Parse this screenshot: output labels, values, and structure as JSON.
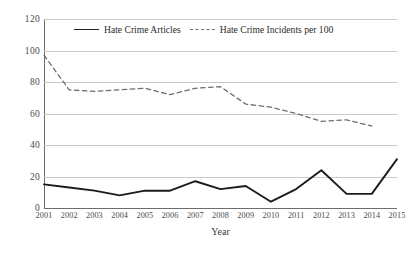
{
  "chart_data": {
    "type": "line",
    "title": "",
    "xlabel": "Year",
    "ylabel": "",
    "grid": true,
    "legend_position": "top-center",
    "xlim": [
      2001,
      2015
    ],
    "ylim": [
      0,
      120
    ],
    "ytick_labels": [
      "120",
      "100",
      "80",
      "60",
      "40",
      "20",
      "0"
    ],
    "ytick_values": [
      120,
      100,
      80,
      60,
      40,
      20,
      0
    ],
    "categories": [
      2001,
      2002,
      2003,
      2004,
      2005,
      2006,
      2007,
      2008,
      2009,
      2010,
      2011,
      2012,
      2013,
      2014,
      2015
    ],
    "xtick_labels": [
      "2001",
      "2002",
      "2003",
      "2004",
      "2005",
      "2006",
      "2007",
      "2008",
      "2009",
      "2010",
      "2011",
      "2012",
      "2013",
      "2014",
      "2015"
    ],
    "series": [
      {
        "name": "Hate Crime Articles",
        "style": "solid",
        "color": "#1c1c1c",
        "values": [
          15,
          13,
          11,
          8,
          11,
          11,
          17,
          12,
          14,
          4,
          12,
          24,
          9,
          9,
          31
        ]
      },
      {
        "name": "Hate Crime Incidents per 100",
        "style": "dashed",
        "color": "#6f6f6f",
        "values": [
          97,
          75,
          74,
          75,
          76,
          72,
          76,
          77,
          66,
          64,
          60,
          55,
          56,
          52,
          null
        ]
      }
    ]
  },
  "legend": {
    "entries": [
      {
        "label": "Hate Crime Articles"
      },
      {
        "label": "Hate Crime Incidents per 100"
      }
    ]
  },
  "axes": {
    "x_title": "Year"
  },
  "colors": {
    "solid_series": "#1c1c1c",
    "dashed_series": "#6f6f6f",
    "gridline": "#c9c9c9",
    "axis": "#6d6d6d",
    "background": "#ffffff"
  }
}
